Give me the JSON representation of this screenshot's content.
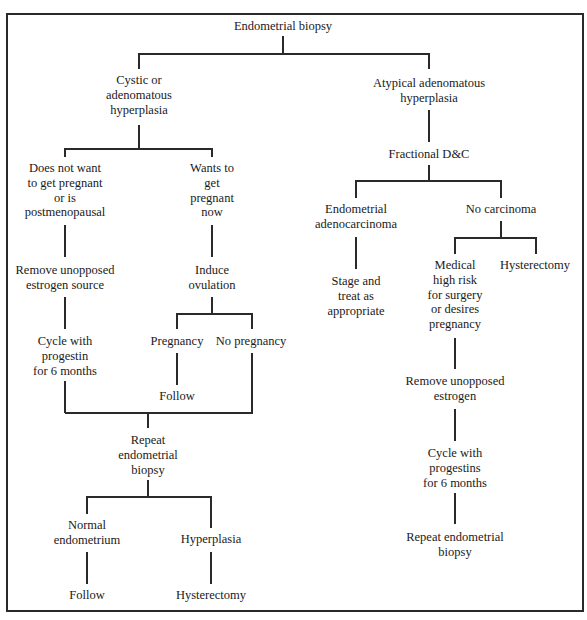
{
  "diagram": {
    "type": "flowchart",
    "root": "Endometrial biopsy",
    "nodes": {
      "root": [
        "Endometrial biopsy"
      ],
      "cystic": [
        "Cystic or",
        "adenomatous",
        "hyperplasia"
      ],
      "no_preg": [
        "Does not want",
        "to get pregnant",
        "or is",
        "postmenopausal"
      ],
      "wants_preg": [
        "Wants to",
        "get",
        "pregnant",
        "now"
      ],
      "remove_source": [
        "Remove unopposed",
        "estrogen source"
      ],
      "induce": [
        "Induce",
        "ovulation"
      ],
      "cycle_left": [
        "Cycle with",
        "progestin",
        "for 6 months"
      ],
      "pregnancy": [
        "Pregnancy"
      ],
      "no_pregnancy": [
        "No pregnancy"
      ],
      "follow_preg": [
        "Follow"
      ],
      "repeat_left": [
        "Repeat",
        "endometrial",
        "biopsy"
      ],
      "normal": [
        "Normal",
        "endometrium"
      ],
      "hyperplasia": [
        "Hyperplasia"
      ],
      "follow_normal": [
        "Follow"
      ],
      "hyst_left": [
        "Hysterectomy"
      ],
      "atypical": [
        "Atypical adenomatous",
        "hyperplasia"
      ],
      "fractional": [
        "Fractional D&C"
      ],
      "adenocarcinoma": [
        "Endometrial",
        "adenocarcinoma"
      ],
      "no_carcinoma": [
        "No carcinoma"
      ],
      "stage": [
        "Stage and",
        "treat as",
        "appropriate"
      ],
      "medical": [
        "Medical",
        "high risk",
        "for surgery",
        "or desires",
        "pregnancy"
      ],
      "hyst_right": [
        "Hysterectomy"
      ],
      "remove_right": [
        "Remove unopposed",
        "estrogen"
      ],
      "cycle_right": [
        "Cycle with",
        "progestins",
        "for 6 months"
      ],
      "repeat_right": [
        "Repeat endometrial",
        "biopsy"
      ]
    },
    "edges": [
      [
        "root",
        "cystic"
      ],
      [
        "root",
        "atypical"
      ],
      [
        "cystic",
        "no_preg"
      ],
      [
        "cystic",
        "wants_preg"
      ],
      [
        "no_preg",
        "remove_source"
      ],
      [
        "remove_source",
        "cycle_left"
      ],
      [
        "wants_preg",
        "induce"
      ],
      [
        "induce",
        "pregnancy"
      ],
      [
        "induce",
        "no_pregnancy"
      ],
      [
        "pregnancy",
        "follow_preg"
      ],
      [
        "cycle_left",
        "repeat_left"
      ],
      [
        "no_pregnancy",
        "repeat_left"
      ],
      [
        "repeat_left",
        "normal"
      ],
      [
        "repeat_left",
        "hyperplasia"
      ],
      [
        "normal",
        "follow_normal"
      ],
      [
        "hyperplasia",
        "hyst_left"
      ],
      [
        "atypical",
        "fractional"
      ],
      [
        "fractional",
        "adenocarcinoma"
      ],
      [
        "fractional",
        "no_carcinoma"
      ],
      [
        "adenocarcinoma",
        "stage"
      ],
      [
        "no_carcinoma",
        "medical"
      ],
      [
        "no_carcinoma",
        "hyst_right"
      ],
      [
        "medical",
        "remove_right"
      ],
      [
        "remove_right",
        "cycle_right"
      ],
      [
        "cycle_right",
        "repeat_right"
      ]
    ]
  }
}
